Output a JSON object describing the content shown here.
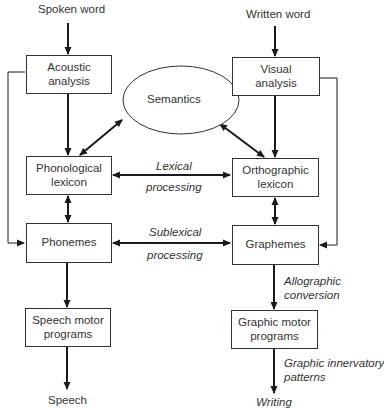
{
  "diagram": {
    "inputs": {
      "spoken": "Spoken word",
      "written": "Written word"
    },
    "outputs": {
      "speech": "Speech",
      "writing": "Writing"
    },
    "nodes": {
      "acoustic": "Acoustic analysis",
      "visual": "Visual analysis",
      "semantics": "Semantics",
      "phonological_lexicon": "Phonological lexicon",
      "orthographic_lexicon": "Orthographic lexicon",
      "phonemes": "Phonemes",
      "graphemes": "Graphemes",
      "speech_motor": "Speech motor programs",
      "graphic_motor": "Graphic motor programs"
    },
    "edge_labels": {
      "lexical_1": "Lexical",
      "lexical_2": "processing",
      "sublexical_1": "Sublexical",
      "sublexical_2": "processing",
      "allographic_1": "Allographic",
      "allographic_2": "conversion",
      "innervatory_1": "Graphic innervatory",
      "innervatory_2": "patterns"
    },
    "colors": {
      "line": "#1a1a1a",
      "box_border": "#333333",
      "text": "#333333",
      "background": "#ffffff"
    }
  }
}
